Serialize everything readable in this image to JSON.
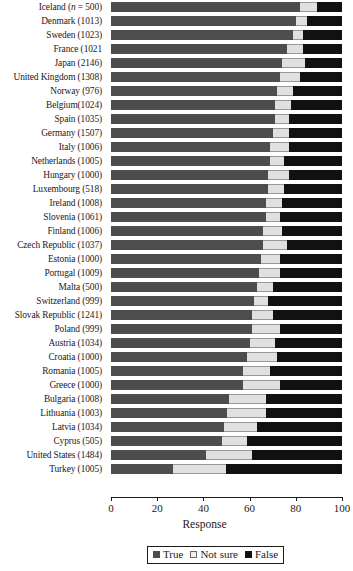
{
  "chart_data": {
    "type": "bar",
    "subtype": "stacked-horizontal-100",
    "title": "",
    "xlabel": "Response",
    "ylabel": "",
    "xlim": [
      0,
      100
    ],
    "xticks": [
      0,
      20,
      40,
      60,
      80,
      100
    ],
    "grid": false,
    "legend_position": "bottom-center",
    "legend": [
      "True",
      "Not sure",
      "False"
    ],
    "colors": {
      "True": "#4d4d4d",
      "Not sure": "#e0e0e0",
      "False": "#111111"
    },
    "categories": [
      "Iceland (n = 500)",
      "Denmark (1013)",
      "Sweden (1023)",
      "France (1021",
      "Japan (2146)",
      "United Kingdom (1308)",
      "Norway (976)",
      "Belgium(1024)",
      "Spain (1035)",
      "Germany (1507)",
      "Italy (1006)",
      "Netherlands (1005)",
      "Hungary (1000)",
      "Luxembourg (518)",
      "Ireland (1008)",
      "Slovenia (1061)",
      "Finland (1006)",
      "Czech Republic (1037)",
      "Estonia (1000)",
      "Portugal (1009)",
      "Malta (500)",
      "Switzerland (999)",
      "Slovak Republic (1241)",
      "Poland (999)",
      "Austria (1034)",
      "Croatia (1000)",
      "Romania (1005)",
      "Greece (1000)",
      "Bulgaria (1008)",
      "Lithuania (1003)",
      "Latvia (1034)",
      "Cyprus (505)",
      "United States (1484)",
      "Turkey (1005)"
    ],
    "series": [
      {
        "name": "True",
        "values": [
          82,
          80,
          79,
          76,
          74,
          73,
          72,
          71,
          71,
          70,
          69,
          69,
          68,
          68,
          67,
          67,
          66,
          66,
          65,
          64,
          63,
          62,
          61,
          61,
          60,
          59,
          57,
          57,
          51,
          50,
          49,
          48,
          41,
          27
        ]
      },
      {
        "name": "Not sure",
        "values": [
          7,
          5,
          4,
          7,
          10,
          9,
          7,
          7,
          6,
          7,
          8,
          6,
          9,
          7,
          7,
          6,
          8,
          10,
          8,
          9,
          7,
          6,
          9,
          12,
          11,
          13,
          12,
          16,
          16,
          17,
          14,
          11,
          20,
          23
        ]
      },
      {
        "name": "False",
        "values": [
          11,
          15,
          17,
          17,
          16,
          18,
          21,
          22,
          23,
          23,
          23,
          25,
          23,
          25,
          26,
          27,
          26,
          24,
          27,
          27,
          30,
          32,
          30,
          27,
          29,
          28,
          31,
          27,
          33,
          33,
          37,
          41,
          39,
          50
        ]
      }
    ]
  },
  "legend": {
    "true_label": "True",
    "notsure_label": "Not sure",
    "false_label": "False"
  },
  "axis": {
    "title": "Response",
    "ticks": [
      "0",
      "20",
      "40",
      "60",
      "80",
      "100"
    ]
  }
}
